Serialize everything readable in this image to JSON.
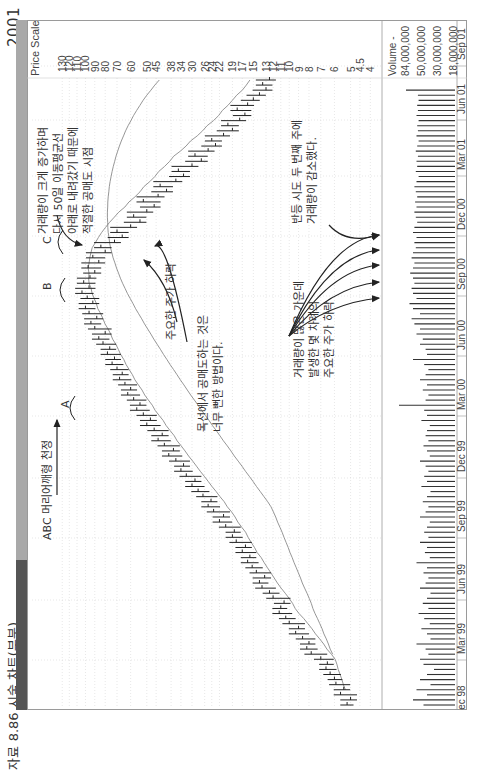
{
  "page": {
    "year_label": "2001",
    "figure_title": "자료 8.86   시술 차트(부분)"
  },
  "annotations": {
    "abc_label": "ABC 머리어깨형 천정",
    "wave_a": "A",
    "wave_b": "B",
    "wave_c": "C",
    "volume_surge": "거래량이 크게 증가하며\n다시 50일 이동평균선\n아래로 내려갔기 때문에\n적절한 공매도 시점",
    "major_drop": "주요한 주가 하락",
    "neckline_short": "목선에서 공매도하는 것은\n너무 뻔한 방법이다.",
    "rebound_volume": "반등 시도 두 번째 주에\n거래량이 감소했다.",
    "heavy_volume_drops": "거래량이 많은 가운데\n발생한 몇 차례의\n주요한 주가 하락"
  },
  "chart_data": {
    "type": "bar",
    "subtype": "weekly OHLC price bars with 10-week and 40-week moving averages, plus volume bars",
    "orientation_note": "chart printed rotated 90 degrees counter-clockwise",
    "title": "",
    "xlabel": "",
    "ylabel": "Price Scale",
    "price_scale_label": "Price Scale",
    "price_scale": "log",
    "price_ticks": [
      130,
      120,
      110,
      100,
      90,
      80,
      70,
      60,
      50,
      45,
      38,
      34,
      30,
      26,
      24,
      22,
      19,
      17,
      15,
      13,
      12,
      11,
      10,
      9,
      8,
      7,
      6,
      5,
      4.5,
      4.0
    ],
    "ylim": [
      4.0,
      130
    ],
    "volume_label": "Volume -",
    "volume_ticks": [
      "84,000,000",
      "50,000,000",
      "30,000,000",
      "18,000,000"
    ],
    "date_labels": [
      "Dec 98",
      "Mar 99",
      "Jun 99",
      "Sep 99",
      "Dec 99",
      "Mar 00",
      "Jun 00",
      "Sep 00",
      "Dec 00",
      "Mar 01",
      "Jun 01",
      "Sep 01"
    ],
    "grid": true,
    "weekly_close": [
      5.2,
      5.0,
      5.6,
      5.4,
      5.9,
      6.0,
      6.3,
      6.6,
      6.5,
      7.0,
      7.8,
      8.2,
      8.0,
      8.6,
      9.3,
      9.0,
      10.0,
      10.4,
      11.2,
      11.0,
      10.6,
      12.0,
      12.5,
      13.6,
      14.0,
      13.2,
      14.5,
      15.2,
      16.0,
      15.6,
      17.0,
      16.4,
      18.2,
      19.0,
      18.6,
      20.5,
      22.0,
      21.0,
      23.5,
      25.0,
      24.2,
      26.5,
      28.0,
      30.0,
      29.0,
      32.0,
      34.0,
      33.0,
      36.0,
      39.0,
      37.0,
      41.0,
      44.0,
      42.0,
      46.0,
      50.0,
      48.0,
      52.0,
      56.0,
      54.0,
      58.0,
      62.0,
      60.0,
      64.0,
      68.0,
      66.0,
      70.0,
      74.0,
      72.0,
      78.0,
      76.0,
      82.0,
      86.0,
      80.0,
      90.0,
      94.0,
      88.0,
      96.0,
      100.0,
      92.0,
      98.0,
      104.0,
      96.0,
      102.0,
      95.0,
      90.0,
      97.0,
      86.0,
      92.0,
      80.0,
      84.0,
      72.0,
      66.0,
      70.0,
      60.0,
      54.0,
      58.0,
      50.0,
      46.0,
      52.0,
      44.0,
      40.0,
      43.0,
      36.0,
      33.0,
      35.0,
      30.0,
      27.0,
      29.0,
      25.0,
      23.0,
      24.0,
      21.0,
      19.0,
      20.0,
      17.5,
      16.5,
      18.0,
      16.0,
      15.0,
      14.0,
      13.0,
      13.5,
      12.5
    ],
    "ma_short_note": "10-week moving average follows closes",
    "ma_long_note": "40-week moving average peaks near Dec 00",
    "volume_relative": [
      0.45,
      0.6,
      0.4,
      0.55,
      0.35,
      0.5,
      0.4,
      0.3,
      0.45,
      0.5,
      0.38,
      0.42,
      0.55,
      0.35,
      0.4,
      0.48,
      0.36,
      0.44,
      0.52,
      0.38,
      0.46,
      0.4,
      0.35,
      0.5,
      0.42,
      0.38,
      0.45,
      0.4,
      0.55,
      0.36,
      0.43,
      0.4,
      0.5,
      0.38,
      0.44,
      0.4,
      0.36,
      0.5,
      0.42,
      0.38,
      0.46,
      0.4,
      0.35,
      0.48,
      0.4,
      0.44,
      0.38,
      0.42,
      0.5,
      0.36,
      0.4,
      0.45,
      0.38,
      0.42,
      0.4,
      0.36,
      0.48,
      0.4,
      0.44,
      0.8,
      0.42,
      0.38,
      0.46,
      0.4,
      0.5,
      0.42,
      0.38,
      0.44,
      0.6,
      0.4,
      0.42,
      0.5,
      0.46,
      0.55,
      0.5,
      0.58,
      0.62,
      0.5,
      0.6,
      0.65,
      0.55,
      0.6,
      0.62,
      0.58,
      0.6,
      0.64,
      0.6,
      0.58,
      0.62,
      0.6,
      0.56,
      0.58,
      0.55,
      0.6,
      0.58,
      0.54,
      0.56,
      0.58,
      0.55,
      0.57,
      0.54,
      0.56,
      0.58,
      0.55,
      0.52,
      0.56,
      0.54,
      0.55,
      0.53,
      0.56,
      0.54,
      0.52,
      0.55,
      0.53,
      0.54,
      0.52,
      0.55,
      0.53,
      0.54,
      0.52,
      0.53,
      0.7
    ]
  }
}
